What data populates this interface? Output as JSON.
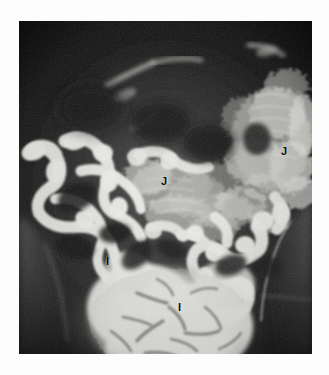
{
  "page": {
    "background_color": "#ffffff",
    "width": 329,
    "height": 375
  },
  "radiograph": {
    "name": "small-bowel-follow-through-radiograph",
    "modality": "fluoroscopic barium radiograph",
    "region": {
      "left": 19,
      "top": 21,
      "width": 293,
      "height": 333
    },
    "film_background_color": "#141414",
    "contrast_color": "#f2f2f0",
    "soft_tissue_color": "#3a3a3a",
    "bone_color": "#6e6e6e"
  },
  "annotations": {
    "markers": [
      {
        "id": "marker-j-right",
        "label": "J",
        "x": 281,
        "y": 146,
        "structure": "jejunum"
      },
      {
        "id": "marker-j-center",
        "label": "J",
        "x": 161,
        "y": 176,
        "structure": "jejunum"
      },
      {
        "id": "marker-i-left",
        "label": "I",
        "x": 106,
        "y": 256,
        "structure": "ileum"
      },
      {
        "id": "marker-i-center",
        "label": "I",
        "x": 178,
        "y": 302,
        "structure": "ileum"
      }
    ]
  }
}
